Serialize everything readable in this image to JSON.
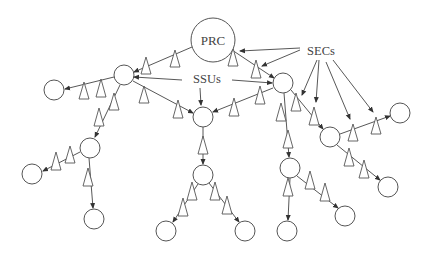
{
  "diagram": {
    "title": "",
    "labels": {
      "prc": "PRC",
      "ssus": "SSUs",
      "secs": "SECs"
    },
    "colors": {
      "stroke": "#555555",
      "line": "#444444",
      "background": "#ffffff"
    },
    "nodes": [
      {
        "id": "prc",
        "type": "PRC",
        "x": 213,
        "y": 40,
        "r": 22
      },
      {
        "id": "ssu_left",
        "type": "SSU",
        "x": 124,
        "y": 75,
        "r": 10
      },
      {
        "id": "ssu_center",
        "type": "SSU",
        "x": 203,
        "y": 117,
        "r": 10
      },
      {
        "id": "ssu_right",
        "type": "SSU",
        "x": 283,
        "y": 83,
        "r": 10
      },
      {
        "id": "n_far_left",
        "type": "node",
        "x": 54,
        "y": 90,
        "r": 10
      },
      {
        "id": "n_left_mid",
        "type": "node",
        "x": 90,
        "y": 148,
        "r": 10
      },
      {
        "id": "n_left_leaf",
        "type": "node",
        "x": 32,
        "y": 174,
        "r": 10
      },
      {
        "id": "n_left_bottom",
        "type": "node",
        "x": 94,
        "y": 219,
        "r": 10
      },
      {
        "id": "n_center_mid",
        "type": "node",
        "x": 203,
        "y": 175,
        "r": 10
      },
      {
        "id": "n_center_bl",
        "type": "node",
        "x": 166,
        "y": 231,
        "r": 10
      },
      {
        "id": "n_center_br",
        "type": "node",
        "x": 245,
        "y": 231,
        "r": 10
      },
      {
        "id": "n_right_mid",
        "type": "node",
        "x": 290,
        "y": 168,
        "r": 10
      },
      {
        "id": "n_right_bl",
        "type": "node",
        "x": 287,
        "y": 231,
        "r": 10
      },
      {
        "id": "n_right_br",
        "type": "node",
        "x": 345,
        "y": 216,
        "r": 10
      },
      {
        "id": "n_right_branch",
        "type": "node",
        "x": 330,
        "y": 137,
        "r": 10
      },
      {
        "id": "n_far_right",
        "type": "node",
        "x": 400,
        "y": 113,
        "r": 10
      },
      {
        "id": "n_right_lower",
        "type": "node",
        "x": 388,
        "y": 187,
        "r": 10
      }
    ],
    "edges": [
      {
        "from": "prc",
        "to": "ssu_left"
      },
      {
        "from": "prc",
        "to": "ssu_right"
      },
      {
        "from": "ssu_left",
        "to": "n_far_left"
      },
      {
        "from": "ssu_left",
        "to": "ssu_center"
      },
      {
        "from": "ssu_left",
        "to": "n_left_mid"
      },
      {
        "from": "ssu_right",
        "to": "ssu_center"
      },
      {
        "from": "ssu_right",
        "to": "n_right_mid"
      },
      {
        "from": "ssu_right",
        "to": "n_right_branch"
      },
      {
        "from": "ssu_center",
        "to": "n_center_mid"
      },
      {
        "from": "n_left_mid",
        "to": "n_left_leaf"
      },
      {
        "from": "n_left_mid",
        "to": "n_left_bottom"
      },
      {
        "from": "n_center_mid",
        "to": "n_center_bl"
      },
      {
        "from": "n_center_mid",
        "to": "n_center_br"
      },
      {
        "from": "n_right_mid",
        "to": "n_right_bl"
      },
      {
        "from": "n_right_mid",
        "to": "n_right_br"
      },
      {
        "from": "n_right_branch",
        "to": "n_far_right"
      },
      {
        "from": "n_right_branch",
        "to": "n_right_lower"
      }
    ],
    "secs_count": 17,
    "legend": {
      "circle": "clock node (PRC / SSU)",
      "triangle": "SEC"
    }
  }
}
